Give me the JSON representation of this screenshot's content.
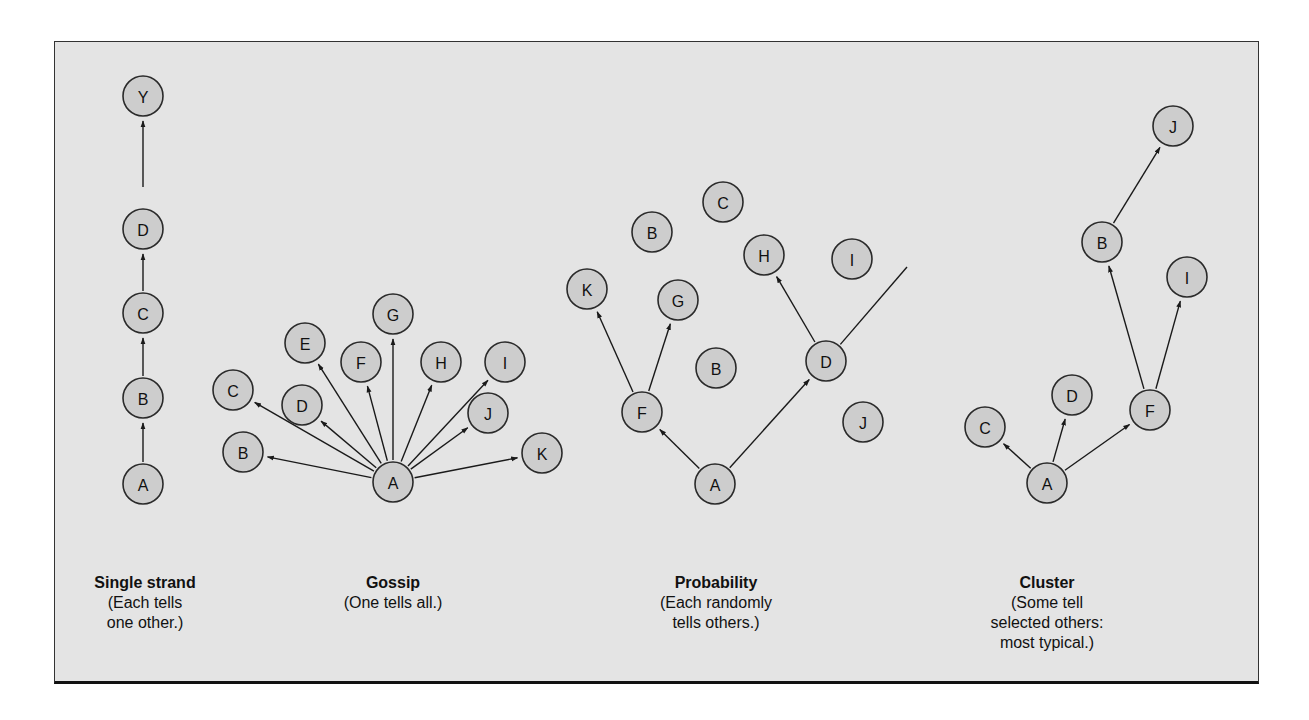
{
  "figure": {
    "colors": {
      "background": "#e4e4e4",
      "node_fill": "#cdcdcd",
      "node_stroke": "#2a2a2a",
      "edge": "#1a1a1a",
      "text": "#111111"
    },
    "node_radius": 20,
    "panels": [
      {
        "id": "single-strand",
        "caption": {
          "title": "Single strand",
          "lines": [
            "(Each tells",
            "one other.)"
          ],
          "center_x": 145,
          "top": 573
        },
        "nodes": [
          {
            "id": "Y",
            "label": "Y",
            "x": 143,
            "y": 96
          },
          {
            "id": "D",
            "label": "D",
            "x": 143,
            "y": 229
          },
          {
            "id": "C",
            "label": "C",
            "x": 143,
            "y": 313
          },
          {
            "id": "B",
            "label": "B",
            "x": 143,
            "y": 398
          },
          {
            "id": "A",
            "label": "A",
            "x": 143,
            "y": 484
          }
        ],
        "edges": [
          {
            "from": "A",
            "to": "B",
            "arrow": true
          },
          {
            "from": "B",
            "to": "C",
            "arrow": true
          },
          {
            "from": "C",
            "to": "D",
            "arrow": true
          },
          {
            "from": "D",
            "to": "Y",
            "arrow": true,
            "start_gap": 42
          }
        ]
      },
      {
        "id": "gossip",
        "caption": {
          "title": "Gossip",
          "lines": [
            "(One tells all.)"
          ],
          "center_x": 393,
          "top": 573
        },
        "nodes": [
          {
            "id": "A",
            "label": "A",
            "x": 393,
            "y": 482
          },
          {
            "id": "B",
            "label": "B",
            "x": 243,
            "y": 452
          },
          {
            "id": "C",
            "label": "C",
            "x": 233,
            "y": 390
          },
          {
            "id": "D",
            "label": "D",
            "x": 302,
            "y": 405
          },
          {
            "id": "E",
            "label": "E",
            "x": 305,
            "y": 343
          },
          {
            "id": "F",
            "label": "F",
            "x": 361,
            "y": 362
          },
          {
            "id": "G",
            "label": "G",
            "x": 393,
            "y": 314
          },
          {
            "id": "H",
            "label": "H",
            "x": 441,
            "y": 362
          },
          {
            "id": "I",
            "label": "I",
            "x": 505,
            "y": 362
          },
          {
            "id": "J",
            "label": "J",
            "x": 488,
            "y": 413
          },
          {
            "id": "K",
            "label": "K",
            "x": 542,
            "y": 453
          }
        ],
        "edges": [
          {
            "from": "A",
            "to": "B",
            "arrow": true
          },
          {
            "from": "A",
            "to": "C",
            "arrow": true
          },
          {
            "from": "A",
            "to": "D",
            "arrow": true
          },
          {
            "from": "A",
            "to": "E",
            "arrow": true
          },
          {
            "from": "A",
            "to": "F",
            "arrow": true
          },
          {
            "from": "A",
            "to": "G",
            "arrow": true
          },
          {
            "from": "A",
            "to": "H",
            "arrow": true
          },
          {
            "from": "A",
            "to": "I",
            "arrow": true
          },
          {
            "from": "A",
            "to": "J",
            "arrow": true
          },
          {
            "from": "A",
            "to": "K",
            "arrow": true
          }
        ]
      },
      {
        "id": "probability",
        "caption": {
          "title": "Probability",
          "lines": [
            "(Each randomly",
            "tells others.)"
          ],
          "center_x": 716,
          "top": 573
        },
        "nodes": [
          {
            "id": "C",
            "label": "C",
            "x": 723,
            "y": 202
          },
          {
            "id": "B1",
            "label": "B",
            "x": 652,
            "y": 232
          },
          {
            "id": "H",
            "label": "H",
            "x": 764,
            "y": 255
          },
          {
            "id": "I",
            "label": "I",
            "x": 852,
            "y": 259
          },
          {
            "id": "K",
            "label": "K",
            "x": 587,
            "y": 289
          },
          {
            "id": "G",
            "label": "G",
            "x": 678,
            "y": 300
          },
          {
            "id": "B2",
            "label": "B",
            "x": 716,
            "y": 368
          },
          {
            "id": "D",
            "label": "D",
            "x": 826,
            "y": 361
          },
          {
            "id": "F",
            "label": "F",
            "x": 642,
            "y": 412
          },
          {
            "id": "J",
            "label": "J",
            "x": 863,
            "y": 422
          },
          {
            "id": "A",
            "label": "A",
            "x": 715,
            "y": 484
          }
        ],
        "edges": [
          {
            "from": "A",
            "to": "F",
            "arrow": true
          },
          {
            "from": "A",
            "to": "D",
            "arrow": true
          },
          {
            "from": "F",
            "to": "K",
            "arrow": true
          },
          {
            "from": "F",
            "to": "G",
            "arrow": true
          },
          {
            "from": "D",
            "to": "H",
            "arrow": true
          },
          {
            "from": "D",
            "to_point": {
              "x": 907,
              "y": 267
            },
            "arrow": false
          }
        ]
      },
      {
        "id": "cluster",
        "caption": {
          "title": "Cluster",
          "lines": [
            "(Some tell",
            "selected others:",
            "most typical.)"
          ],
          "center_x": 1047,
          "top": 573
        },
        "nodes": [
          {
            "id": "J",
            "label": "J",
            "x": 1173,
            "y": 126
          },
          {
            "id": "B",
            "label": "B",
            "x": 1102,
            "y": 242
          },
          {
            "id": "I",
            "label": "I",
            "x": 1187,
            "y": 277
          },
          {
            "id": "D",
            "label": "D",
            "x": 1072,
            "y": 395
          },
          {
            "id": "F",
            "label": "F",
            "x": 1150,
            "y": 410
          },
          {
            "id": "C",
            "label": "C",
            "x": 985,
            "y": 427
          },
          {
            "id": "A",
            "label": "A",
            "x": 1047,
            "y": 483
          }
        ],
        "edges": [
          {
            "from": "A",
            "to": "C",
            "arrow": true
          },
          {
            "from": "A",
            "to": "D",
            "arrow": true
          },
          {
            "from": "A",
            "to": "F",
            "arrow": true
          },
          {
            "from": "F",
            "to": "B",
            "arrow": true
          },
          {
            "from": "F",
            "to": "I",
            "arrow": true
          },
          {
            "from": "B",
            "to": "J",
            "arrow": true
          }
        ]
      }
    ]
  }
}
